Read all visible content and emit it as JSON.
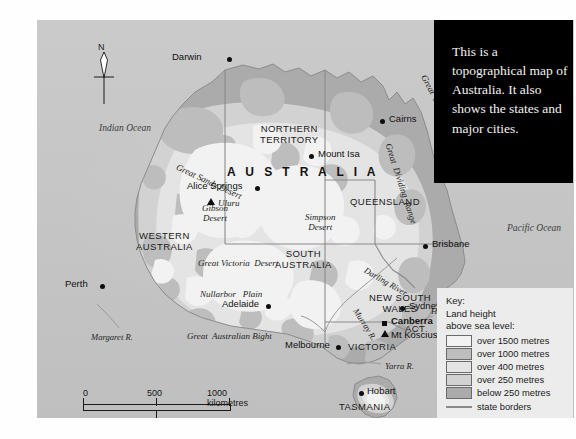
{
  "caption": {
    "text": "This is a topographical map of Australia. It also shows the states and major cities."
  },
  "compass": {
    "north_label": "N"
  },
  "oceans": [
    {
      "name": "Indian Ocean",
      "x": 62,
      "y": 103
    },
    {
      "name": "Pacific Ocean",
      "x": 470,
      "y": 203
    }
  ],
  "country_label": "A U S T R A L I A",
  "states": [
    {
      "name": "NORTHERN\nTERRITORY",
      "x": 227,
      "y": 108
    },
    {
      "name": "QUEENSLAND",
      "x": 315,
      "y": 176
    },
    {
      "name": "WESTERN\nAUSTRALIA",
      "x": 104,
      "y": 209
    },
    {
      "name": "SOUTH\nAUSTRALIA",
      "x": 240,
      "y": 230
    },
    {
      "name": "NEW SOUTH\nWALES",
      "x": 336,
      "y": 274
    },
    {
      "name": "VICTORIA",
      "x": 313,
      "y": 322
    },
    {
      "name": "TASMANIA",
      "x": 304,
      "y": 382
    },
    {
      "name": "ACT",
      "x": 370,
      "y": 306
    }
  ],
  "cities": [
    {
      "name": "Darwin",
      "x": 202,
      "y": 56,
      "marker": "dot",
      "bold": false,
      "anchor": "right"
    },
    {
      "name": "Cairns",
      "x": 388,
      "y": 117,
      "marker": "dot",
      "bold": false,
      "anchor": "left"
    },
    {
      "name": "Mount Isa",
      "x": 311,
      "y": 152,
      "marker": "dot",
      "bold": false,
      "anchor": "left"
    },
    {
      "name": "Alice Springs",
      "x": 205,
      "y": 184,
      "marker": "dot",
      "bold": false,
      "anchor": "right"
    },
    {
      "name": "Brisbane",
      "x": 425,
      "y": 243,
      "marker": "dot",
      "bold": false,
      "anchor": "left"
    },
    {
      "name": "Perth",
      "x": 63,
      "y": 283,
      "marker": "dot",
      "bold": false,
      "anchor": "right"
    },
    {
      "name": "Adelaide",
      "x": 262,
      "y": 303,
      "marker": "dot",
      "bold": false,
      "anchor": "right"
    },
    {
      "name": "Sydney",
      "x": 398,
      "y": 305,
      "marker": "dot",
      "bold": false,
      "anchor": "left"
    },
    {
      "name": "Canberra",
      "x": 382,
      "y": 320,
      "marker": "sq",
      "bold": true,
      "anchor": "left"
    },
    {
      "name": "Melbourne",
      "x": 299,
      "y": 344,
      "marker": "dot",
      "bold": false,
      "anchor": "right"
    },
    {
      "name": "Hobart",
      "x": 355,
      "y": 390,
      "marker": "dot",
      "bold": false,
      "anchor": "left"
    }
  ],
  "peaks": [
    {
      "name": "Uluru",
      "x": 209,
      "y": 199,
      "marker": "tri"
    },
    {
      "name": "Mt Kosciuszko",
      "x": 381,
      "y": 331,
      "marker": "tri"
    }
  ],
  "features": [
    {
      "name": "Great Sandy Desert",
      "x": 142,
      "y": 142,
      "rot": 25,
      "size": 9.2
    },
    {
      "name": "Gibson\nDesert",
      "x": 167,
      "y": 184,
      "rot": 0,
      "size": 9.2
    },
    {
      "name": "Simpson\nDesert",
      "x": 271,
      "y": 193,
      "rot": 0,
      "size": 9.2
    },
    {
      "name": "Great Victoria  Desert",
      "x": 165,
      "y": 238,
      "rot": 0,
      "size": 9.2
    },
    {
      "name": "Nullarbor   Plain",
      "x": 166,
      "y": 269,
      "rot": 0,
      "size": 9.2
    },
    {
      "name": "Great  Australian Bight",
      "x": 153,
      "y": 311,
      "rot": 0,
      "size": 9.2
    },
    {
      "name": "Great  Barrier  Reef",
      "x": 398,
      "y": 60,
      "rot": 62,
      "size": 9.2
    },
    {
      "name": "Great  Dividing  Range",
      "x": 363,
      "y": 130,
      "rot": 72,
      "size": 9.2
    }
  ],
  "rivers": [
    {
      "name": "Margaret R.",
      "x": 57,
      "y": 314,
      "rot": 0
    },
    {
      "name": "Darling River",
      "x": 334,
      "y": 253,
      "rot": 30
    },
    {
      "name": "Murray R.",
      "x": 327,
      "y": 293,
      "rot": 58
    },
    {
      "name": "Hunter R.",
      "x": 398,
      "y": 289,
      "rot": 0
    },
    {
      "name": "Yarra R.",
      "x": 352,
      "y": 343,
      "rot": 0
    }
  ],
  "key": {
    "title": "Key:",
    "subtitle_1": "Land height",
    "subtitle_2": "above sea level:",
    "entries": [
      {
        "label": "over 1500 metres",
        "color": "#f2f2f2"
      },
      {
        "label": "over 1000 metres",
        "color": "#bdbdbd"
      },
      {
        "label": "over 400 metres",
        "color": "#e4e4e4"
      },
      {
        "label": "over 250 metres",
        "color": "#d2d2d2"
      },
      {
        "label": "below 250 metres",
        "color": "#ababab"
      }
    ],
    "border_label": "state borders",
    "border_color": "#8a8a8a"
  },
  "scale": {
    "km": {
      "ticks": [
        "0",
        "500",
        "1000 kilometres"
      ]
    },
    "miles": {
      "ticks": [
        "0",
        "300",
        "600 miles"
      ]
    }
  },
  "colors": {
    "ocean": "#c7c7c7",
    "land_low": "#ababab",
    "land_250": "#d2d2d2",
    "land_400": "#e4e4e4",
    "land_1000": "#bdbdbd",
    "land_1500": "#f2f2f2",
    "caption_bg": "#000000",
    "key_bg": "#ececec"
  }
}
